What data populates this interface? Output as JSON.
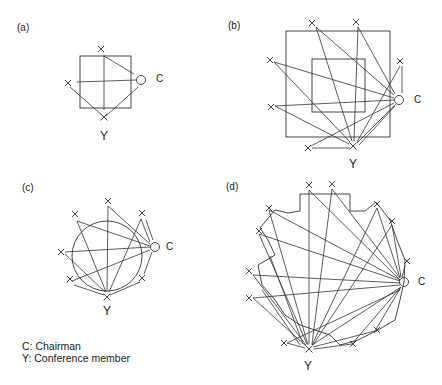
{
  "panels": [
    {
      "id": "a",
      "label": "(a)",
      "label_pos": [
        17,
        31
      ],
      "chair": {
        "pos": [
          141,
          80
        ],
        "label": "C",
        "label_pos": [
          156,
          82
        ]
      },
      "member": {
        "pos": [
          104,
          117
        ],
        "label": "Y",
        "label_pos": [
          100,
          140
        ]
      },
      "others": [
        [
          101,
          49
        ],
        [
          68,
          83
        ]
      ],
      "rects": [
        [
          80,
          56,
          51,
          52
        ]
      ],
      "lines": [
        [
          104,
          55,
          104,
          110
        ],
        [
          77,
          82,
          136,
          80
        ],
        [
          104,
          56,
          134,
          74
        ],
        [
          70,
          87,
          103,
          116
        ],
        [
          106,
          116,
          138,
          87
        ]
      ]
    },
    {
      "id": "b",
      "label": "(b)",
      "label_pos": [
        228,
        29
      ],
      "chair": {
        "pos": [
          399,
          100
        ],
        "label": "C",
        "label_pos": [
          414,
          103
        ]
      },
      "member": {
        "pos": [
          353,
          146
        ],
        "label": "Y",
        "label_pos": [
          349,
          168
        ]
      },
      "others": [
        [
          312,
          23
        ],
        [
          356,
          22
        ],
        [
          400,
          61
        ],
        [
          270,
          60
        ],
        [
          271,
          107
        ],
        [
          308,
          148
        ]
      ],
      "rects": [
        [
          286,
          31,
          104,
          106
        ],
        [
          312,
          59,
          53,
          53
        ]
      ],
      "lines": [
        [
          316,
          27,
          394,
          95
        ],
        [
          316,
          27,
          352,
          141
        ],
        [
          358,
          27,
          395,
          94
        ],
        [
          358,
          27,
          354,
          141
        ],
        [
          274,
          62,
          394,
          98
        ],
        [
          274,
          62,
          350,
          142
        ],
        [
          275,
          106,
          394,
          100
        ],
        [
          275,
          106,
          349,
          144
        ],
        [
          311,
          146,
          394,
          103
        ],
        [
          312,
          148,
          350,
          148
        ],
        [
          357,
          143,
          396,
          104
        ],
        [
          359,
          145,
          395,
          106
        ],
        [
          400,
          66,
          357,
          142
        ],
        [
          402,
          66,
          402,
          93
        ]
      ]
    },
    {
      "id": "c",
      "label": "(c)",
      "label_pos": [
        22,
        191
      ],
      "chair": {
        "pos": [
          155,
          247
        ],
        "label": "C",
        "label_pos": [
          166,
          250
        ]
      },
      "member": {
        "pos": [
          107,
          297
        ],
        "label": "Y",
        "label_pos": [
          103,
          315
        ]
      },
      "others": [
        [
          108,
          201
        ],
        [
          75,
          214
        ],
        [
          142,
          213
        ],
        [
          61,
          252
        ],
        [
          70,
          279
        ],
        [
          142,
          278
        ]
      ],
      "circle": [
        107,
        256,
        35
      ],
      "lines": [
        [
          108,
          206,
          150,
          244
        ],
        [
          108,
          206,
          107,
          291
        ],
        [
          77,
          221,
          150,
          246
        ],
        [
          77,
          221,
          106,
          292
        ],
        [
          141,
          219,
          150,
          242
        ],
        [
          141,
          219,
          109,
          292
        ],
        [
          65,
          252,
          150,
          247
        ],
        [
          65,
          254,
          105,
          292
        ],
        [
          72,
          281,
          150,
          250
        ],
        [
          74,
          285,
          104,
          295
        ],
        [
          140,
          282,
          110,
          295
        ],
        [
          144,
          274,
          152,
          252
        ],
        [
          146,
          220,
          153,
          240
        ]
      ]
    },
    {
      "id": "d",
      "label": "(d)",
      "label_pos": [
        226,
        190
      ],
      "chair": {
        "pos": [
          404,
          282
        ],
        "label": "C",
        "label_pos": [
          418,
          285
        ]
      },
      "member": {
        "pos": [
          309,
          349
        ],
        "label": "Y",
        "label_pos": [
          304,
          370
        ]
      },
      "others": [
        [
          309,
          185
        ],
        [
          332,
          184
        ],
        [
          269,
          208
        ],
        [
          259,
          231
        ],
        [
          249,
          271
        ],
        [
          249,
          298
        ],
        [
          377,
          204
        ],
        [
          392,
          221
        ],
        [
          407,
          261
        ],
        [
          377,
          330
        ],
        [
          353,
          344
        ],
        [
          284,
          343
        ]
      ],
      "polygon": [
        [
          300,
          194
        ],
        [
          350,
          194
        ],
        [
          350,
          211
        ],
        [
          365,
          211
        ],
        [
          376,
          202
        ],
        [
          390,
          220
        ],
        [
          397,
          240
        ],
        [
          405,
          260
        ],
        [
          404,
          282
        ],
        [
          400,
          300
        ],
        [
          395,
          320
        ],
        [
          378,
          330
        ],
        [
          358,
          340
        ],
        [
          340,
          345
        ],
        [
          330,
          335
        ],
        [
          315,
          330
        ],
        [
          300,
          325
        ],
        [
          285,
          315
        ],
        [
          275,
          300
        ],
        [
          262,
          285
        ],
        [
          258,
          265
        ],
        [
          275,
          255
        ],
        [
          268,
          240
        ],
        [
          260,
          228
        ],
        [
          275,
          210
        ],
        [
          288,
          213
        ],
        [
          300,
          211
        ]
      ],
      "lines": [
        [
          309,
          190,
          309,
          344
        ],
        [
          309,
          190,
          400,
          280
        ],
        [
          332,
          189,
          312,
          344
        ],
        [
          332,
          189,
          400,
          278
        ],
        [
          269,
          210,
          400,
          280
        ],
        [
          269,
          210,
          308,
          345
        ],
        [
          259,
          234,
          400,
          281
        ],
        [
          259,
          234,
          307,
          344
        ],
        [
          253,
          275,
          400,
          283
        ],
        [
          253,
          275,
          306,
          345
        ],
        [
          253,
          298,
          400,
          285
        ],
        [
          253,
          298,
          306,
          346
        ],
        [
          377,
          208,
          400,
          278
        ],
        [
          377,
          208,
          312,
          345
        ],
        [
          392,
          225,
          401,
          277
        ],
        [
          392,
          225,
          313,
          345
        ],
        [
          405,
          265,
          402,
          278
        ],
        [
          375,
          331,
          401,
          287
        ],
        [
          375,
          331,
          313,
          347
        ],
        [
          352,
          344,
          400,
          288
        ],
        [
          352,
          344,
          314,
          349
        ],
        [
          287,
          343,
          305,
          348
        ],
        [
          287,
          343,
          400,
          290
        ],
        [
          312,
          345,
          401,
          287
        ],
        [
          262,
          290,
          300,
          345
        ],
        [
          270,
          256,
          303,
          344
        ]
      ]
    }
  ],
  "legend": {
    "chair": "C: Chairman",
    "member": "Y: Conference member"
  }
}
